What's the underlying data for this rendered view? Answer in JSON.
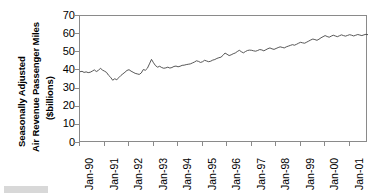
{
  "axis_titles": {
    "line1": "Seasonally Adjusted",
    "line2": "Air Revenue Passenger Miles",
    "line3": "($billions)"
  },
  "chart_data": {
    "type": "line",
    "title": "",
    "subtitle": "",
    "xlabel": "",
    "ylabel": "Seasonally Adjusted Air Revenue Passenger Miles ($billions)",
    "ylim": [
      0,
      70
    ],
    "yticks": [
      0,
      10,
      20,
      30,
      40,
      50,
      60,
      70
    ],
    "ytick_labels": [
      "0",
      "10",
      "20",
      "30",
      "40",
      "50",
      "60",
      "70"
    ],
    "xtick_labels": [
      "Jan-90",
      "Jan-91",
      "Jan-92",
      "Jan-93",
      "Jan-94",
      "Jan-95",
      "Jan-96",
      "Jan-97",
      "Jan-98",
      "Jan-99",
      "Jan-00",
      "Jan-01"
    ],
    "x_start": "Jan-90",
    "x_end": "Dec-01",
    "x_frequency": "monthly",
    "grid": false,
    "legend": "none",
    "line_color": "#444444",
    "series": [
      {
        "name": "Air Revenue Passenger Miles",
        "values": [
          39.3,
          39.5,
          38.9,
          39.2,
          38.8,
          39.0,
          39.6,
          40.3,
          39.4,
          40.0,
          41.2,
          40.2,
          39.6,
          38.9,
          37.3,
          36.2,
          34.6,
          35.4,
          34.9,
          36.0,
          37.2,
          38.1,
          39.0,
          40.0,
          40.4,
          39.6,
          39.0,
          38.4,
          38.1,
          37.8,
          38.6,
          40.5,
          40.1,
          41.2,
          43.6,
          46.1,
          44.2,
          42.6,
          41.8,
          42.3,
          41.6,
          41.2,
          41.4,
          41.8,
          41.3,
          41.6,
          42.2,
          42.4,
          42.0,
          42.3,
          42.8,
          42.9,
          43.2,
          43.4,
          43.6,
          44.1,
          44.6,
          45.3,
          45.0,
          44.4,
          44.8,
          45.6,
          45.2,
          44.8,
          45.1,
          45.7,
          46.0,
          46.6,
          47.0,
          47.3,
          48.3,
          49.6,
          48.9,
          48.2,
          48.6,
          49.2,
          49.6,
          50.4,
          51.1,
          50.3,
          49.7,
          50.4,
          51.0,
          51.2,
          51.1,
          50.8,
          50.6,
          51.0,
          51.5,
          51.3,
          50.8,
          51.4,
          52.0,
          52.4,
          51.9,
          51.6,
          52.1,
          52.6,
          53.0,
          52.7,
          52.4,
          53.0,
          53.4,
          53.8,
          54.2,
          53.9,
          54.4,
          55.0,
          55.5,
          55.2,
          55.0,
          55.6,
          56.2,
          56.8,
          57.3,
          57.0,
          56.6,
          57.2,
          58.0,
          58.6,
          59.2,
          58.7,
          58.3,
          58.9,
          59.4,
          59.0,
          58.6,
          59.1,
          59.6,
          59.2,
          58.9,
          59.3,
          59.7,
          59.4,
          59.0,
          59.4,
          59.8,
          59.5,
          59.2,
          59.6,
          59.9,
          59.7
        ]
      }
    ]
  }
}
